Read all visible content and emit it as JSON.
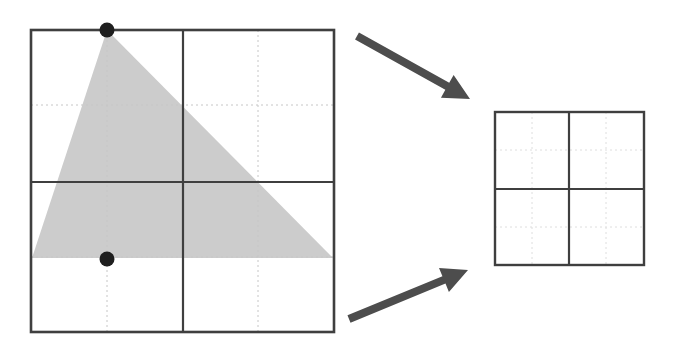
{
  "figure": {
    "title": "",
    "background_color": "#ffffff",
    "width": 673,
    "height": 350
  },
  "colors": {
    "square_stroke": "#3f3f3f",
    "grid_dotted": "#dedede",
    "triangle_fill": "#cccccc",
    "point_fill": "#1f1f1f",
    "arrow_fill": "#4d4d4d",
    "background": "#ffffff"
  },
  "source_square": {
    "label": "large-square",
    "x": 31,
    "y": 30,
    "width": 303,
    "height": 302,
    "stroke_width": 2.6,
    "mid_lines": {
      "vertical_x": 183,
      "horizontal_y": 182,
      "stroke_width": 2.2
    },
    "dotted_lines": {
      "vertical_x": [
        107,
        258
      ],
      "horizontal_y": [
        105,
        257
      ],
      "stroke_width": 1,
      "dash_pattern": "2 3"
    }
  },
  "triangle": {
    "label": "shaded-triangle",
    "vertices": [
      {
        "name": "apex",
        "x": 107,
        "y": 30
      },
      {
        "name": "bottom-left",
        "x": 32,
        "y": 258
      },
      {
        "name": "bottom-right",
        "x": 333,
        "y": 258
      }
    ],
    "fill": "#cccccc"
  },
  "points": [
    {
      "name": "top-point",
      "x": 107,
      "y": 30,
      "radius": 7.5
    },
    {
      "name": "bottom-point",
      "x": 107,
      "y": 259,
      "radius": 7.5
    }
  ],
  "arrows": [
    {
      "name": "upper-arrow",
      "from_x": 357,
      "from_y": 36,
      "to_x": 470,
      "to_y": 99,
      "shaft_width": 8,
      "head_length": 26,
      "head_width": 26
    },
    {
      "name": "lower-arrow",
      "from_x": 349,
      "from_y": 319,
      "to_x": 468,
      "to_y": 270,
      "shaft_width": 8,
      "head_length": 26,
      "head_width": 26
    }
  ],
  "target_square": {
    "label": "small-square",
    "x": 495,
    "y": 112,
    "width": 149,
    "height": 153,
    "stroke_width": 2.4,
    "mid_lines": {
      "vertical_x": 569,
      "horizontal_y": 189,
      "stroke_width": 2.2
    },
    "dotted_lines": {
      "vertical_x": [
        532,
        606
      ],
      "horizontal_y": [
        150,
        227
      ],
      "stroke_width": 1,
      "dash_pattern": "2 3"
    }
  }
}
